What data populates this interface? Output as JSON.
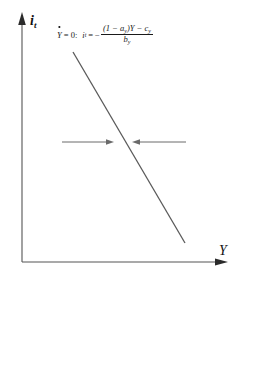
{
  "figure": {
    "type": "phase-diagram",
    "background_color": "#ffffff",
    "axes": {
      "y_axis": {
        "label": "i",
        "label_subscript": "t",
        "has_arrowhead": true,
        "color": "#555555",
        "x": 22,
        "y_top": 18,
        "y_bottom": 262
      },
      "x_axis": {
        "label": "Y",
        "has_arrowhead": true,
        "color": "#555555",
        "y": 262,
        "x_left": 22,
        "x_right": 226
      },
      "origin": [
        22,
        262
      ]
    },
    "locus": {
      "name": "Y-dot-equals-zero-locus",
      "color": "#555555",
      "x1": 73,
      "y1": 52,
      "x2": 185,
      "y2": 243,
      "slope_direction": "downward"
    },
    "equation": {
      "condition_var": "Y",
      "condition_dot": "˙",
      "condition_equals": "= 0:",
      "lhs_var": "i",
      "lhs_subscript": "t",
      "equals": "=",
      "minus_sign": "−",
      "numerator": "(1 − a",
      "numerator_sub": "y",
      "numerator_mid": ")Y − c",
      "numerator_sub2": "y",
      "denominator": "b",
      "denominator_sub": "y",
      "full_text": "Ẏ = 0:  i_t = − ((1−a_y)Y − c_y) / b_y"
    },
    "arrows": [
      {
        "name": "left-convergence-arrow",
        "direction": "right",
        "x_start": 62,
        "x_end": 113,
        "y": 142,
        "color": "#555555"
      },
      {
        "name": "right-convergence-arrow",
        "direction": "left",
        "x_start": 186,
        "x_end": 133,
        "y": 142,
        "color": "#555555"
      }
    ]
  }
}
